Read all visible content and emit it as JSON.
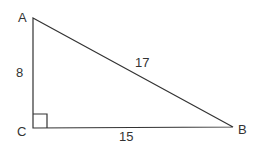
{
  "diagram": {
    "type": "right-triangle",
    "vertices": {
      "A": {
        "label": "A",
        "x": 33,
        "y": 18
      },
      "B": {
        "label": "B",
        "x": 233,
        "y": 127
      },
      "C": {
        "label": "C",
        "x": 33,
        "y": 128
      }
    },
    "sides": {
      "AC": {
        "label": "8"
      },
      "AB": {
        "label": "17"
      },
      "CB": {
        "label": "15"
      }
    },
    "right_angle_at": "C",
    "stroke_color": "#333333",
    "label_color": "#333333"
  }
}
